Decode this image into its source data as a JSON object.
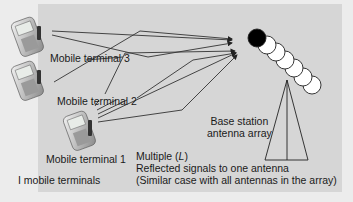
{
  "diagram": {
    "labels": {
      "terminal3": "Mobile terminal 3",
      "terminal2": "Mobile terminal 2",
      "terminal1": "Mobile terminal 1",
      "count": "I mobile terminals",
      "base_station_line1": "Base station",
      "base_station_line2": "antenna array",
      "multipath_line1_prefix": "Multiple (",
      "multipath_line1_var": "L",
      "multipath_line1_suffix": ")",
      "multipath_line2": "Reflected signals to one antenna",
      "multipath_line3": "(Similar case with all antennas in the array)"
    },
    "nodes": [
      {
        "id": "terminal3",
        "type": "mobile-phone"
      },
      {
        "id": "terminal2",
        "type": "mobile-phone"
      },
      {
        "id": "terminal1",
        "type": "mobile-phone"
      },
      {
        "id": "base-station",
        "type": "antenna-array",
        "elements": 7,
        "highlighted_element": 1
      }
    ],
    "colors": {
      "panel": "#d6d6d6",
      "background": "#ececec",
      "lines": "#333333",
      "active_antenna": "#000000",
      "antenna": "#ffffff"
    }
  }
}
